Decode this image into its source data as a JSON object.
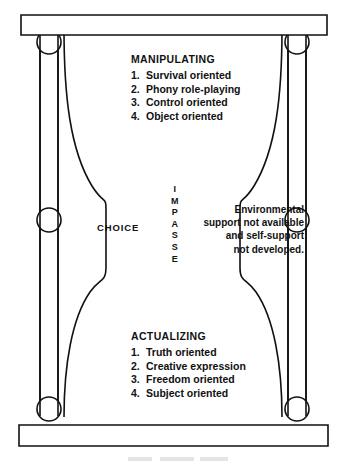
{
  "figure": {
    "colors": {
      "ink": "#111111",
      "background": "#ffffff"
    }
  },
  "manipulating": {
    "heading": "MANIPULATING",
    "items": [
      {
        "num": "1.",
        "label": "Survival oriented"
      },
      {
        "num": "2.",
        "label": "Phony role-playing"
      },
      {
        "num": "3.",
        "label": "Control oriented"
      },
      {
        "num": "4.",
        "label": "Object oriented"
      }
    ]
  },
  "actualizing": {
    "heading": "ACTUALIZING",
    "items": [
      {
        "num": "1.",
        "label": "Truth oriented"
      },
      {
        "num": "2.",
        "label": "Creative expression"
      },
      {
        "num": "3.",
        "label": "Freedom oriented"
      },
      {
        "num": "4.",
        "label": "Subject oriented"
      }
    ]
  },
  "choice": {
    "label": "CHOICE"
  },
  "impasse": {
    "letters": [
      "I",
      "M",
      "P",
      "A",
      "S",
      "S",
      "E"
    ]
  },
  "support_note": {
    "lines": [
      "Environmental",
      "support not available",
      "and self-support",
      "not developed."
    ]
  }
}
